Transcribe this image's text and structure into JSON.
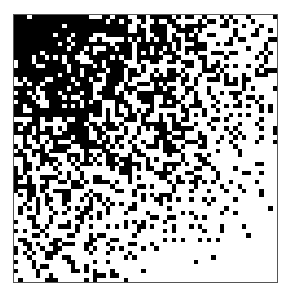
{
  "image": {
    "description": "Dithered diagonal gradient from black (top-left) to white (bottom-right)",
    "grid_cells": 60,
    "dark_color": "#000000",
    "light_color": "#ffffff",
    "border_color": "#555555",
    "gradient_direction": "top-left-dark-to-bottom-right-light"
  }
}
